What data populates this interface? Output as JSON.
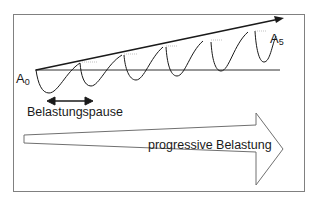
{
  "diagram": {
    "type": "supercompensation-progressive-load",
    "labels": {
      "start": {
        "base": "A",
        "sub": "0"
      },
      "end": {
        "base": "A",
        "sub": "5"
      },
      "pause": "Belastungspause",
      "progressive": "progressive Belastung"
    },
    "colors": {
      "line": "#1a1a1a",
      "border": "#808080",
      "arrow_outline": "#707070",
      "background": "#ffffff"
    },
    "cycles": 6
  }
}
